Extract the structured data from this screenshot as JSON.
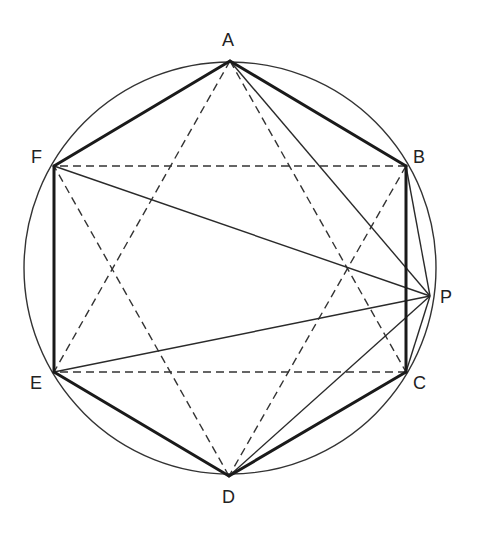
{
  "diagram": {
    "circle": {
      "cx": 230,
      "cy": 268,
      "r": 206
    },
    "points": {
      "A": {
        "x": 230,
        "y": 61,
        "label": "A",
        "lx": 222,
        "ly": 46
      },
      "B": {
        "x": 406,
        "y": 166,
        "label": "B",
        "lx": 413,
        "ly": 163
      },
      "C": {
        "x": 406,
        "y": 372,
        "label": "C",
        "lx": 413,
        "ly": 389
      },
      "D": {
        "x": 229,
        "y": 476,
        "label": "D",
        "lx": 222,
        "ly": 503
      },
      "E": {
        "x": 54,
        "y": 372,
        "label": "E",
        "lx": 30,
        "ly": 389
      },
      "F": {
        "x": 54,
        "y": 166,
        "label": "F",
        "lx": 31,
        "ly": 163
      },
      "P": {
        "x": 430,
        "y": 296,
        "label": "P",
        "lx": 440,
        "ly": 303
      }
    },
    "hexagon_edges": [
      [
        "A",
        "B"
      ],
      [
        "B",
        "C"
      ],
      [
        "C",
        "D"
      ],
      [
        "D",
        "E"
      ],
      [
        "E",
        "F"
      ],
      [
        "F",
        "A"
      ]
    ],
    "dashed_diagonals": [
      [
        "A",
        "C"
      ],
      [
        "A",
        "E"
      ],
      [
        "C",
        "E"
      ],
      [
        "B",
        "D"
      ],
      [
        "B",
        "F"
      ],
      [
        "D",
        "F"
      ]
    ],
    "lines_from_P": [
      [
        "P",
        "A"
      ],
      [
        "P",
        "B"
      ],
      [
        "P",
        "C"
      ],
      [
        "P",
        "D"
      ],
      [
        "P",
        "E"
      ],
      [
        "P",
        "F"
      ]
    ]
  }
}
